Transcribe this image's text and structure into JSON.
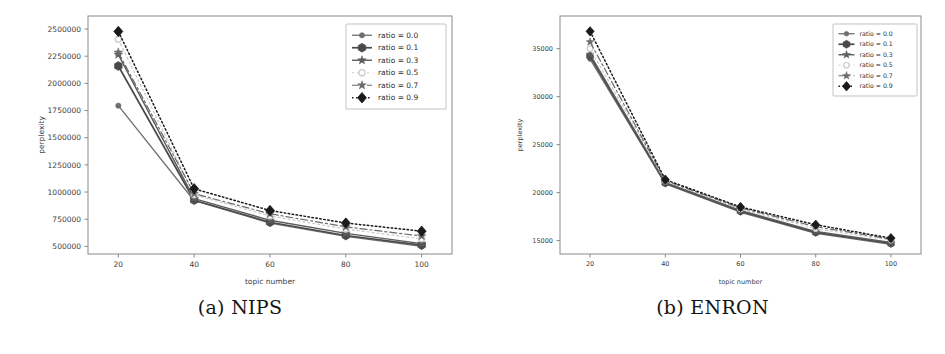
{
  "figure": {
    "subfigures": [
      {
        "id": "a",
        "caption": "(a) NIPS",
        "caption_tag": "(a)",
        "caption_name": "NIPS"
      },
      {
        "id": "b",
        "caption": "(b) ENRON",
        "caption_tag": "(b)",
        "caption_name": "ENRON"
      }
    ]
  },
  "chart_data": [
    {
      "type": "line",
      "id": "nips",
      "title": "(a) NIPS",
      "xlabel": "topic number",
      "ylabel": "perplexity",
      "x": [
        20,
        40,
        60,
        80,
        100
      ],
      "xticklabels": [
        "20",
        "40",
        "60",
        "80",
        "100"
      ],
      "xlim": [
        12,
        108
      ],
      "ylim": [
        430000,
        2620000
      ],
      "yticks": [
        500000,
        750000,
        1000000,
        1250000,
        1500000,
        1750000,
        2000000,
        2250000,
        2500000
      ],
      "yticklabels": [
        "500000",
        "750000",
        "1000000",
        "1250000",
        "1500000",
        "1750000",
        "2000000",
        "2250000",
        "2500000"
      ],
      "grid": false,
      "legend_position": "upper right",
      "series": [
        {
          "name": "ratio = 0.0",
          "values": [
            1795000,
            920000,
            715000,
            592000,
            500000
          ],
          "color": "#6f6f6f",
          "marker": "circle",
          "dash": "none",
          "width": 1.3,
          "markersize": 3.2
        },
        {
          "name": "ratio = 0.1",
          "values": [
            2160000,
            925000,
            722000,
            600000,
            512000
          ],
          "color": "#4a4a4a",
          "marker": "hexagon",
          "dash": "none",
          "width": 1.7,
          "markersize": 4.4
        },
        {
          "name": "ratio = 0.3",
          "values": [
            2265000,
            940000,
            740000,
            620000,
            525000
          ],
          "color": "#5c5c5c",
          "marker": "star",
          "dash": "none",
          "width": 1.4,
          "markersize": 4.0
        },
        {
          "name": "ratio = 0.5",
          "values": [
            2405000,
            975000,
            780000,
            660000,
            570000
          ],
          "color": "#c9c9c9",
          "marker": "circle-open",
          "dash": "2,3",
          "width": 1.2,
          "markersize": 3.6
        },
        {
          "name": "ratio = 0.7",
          "values": [
            2285000,
            985000,
            800000,
            680000,
            595000
          ],
          "color": "#6a6a6a",
          "marker": "plus-star",
          "dash": "7,3,2,3",
          "width": 1.2,
          "markersize": 4.0
        },
        {
          "name": "ratio = 0.9",
          "values": [
            2478000,
            1030000,
            830000,
            715000,
            640000
          ],
          "color": "#1a1a1a",
          "marker": "diamond",
          "dash": "1.5,2.5",
          "width": 1.5,
          "markersize": 5.2
        }
      ]
    },
    {
      "type": "line",
      "id": "enron",
      "title": "(b) ENRON",
      "xlabel": "topic number",
      "ylabel": "perplexity",
      "x": [
        20,
        40,
        60,
        80,
        100
      ],
      "xticklabels": [
        "20",
        "40",
        "60",
        "80",
        "100"
      ],
      "xlim": [
        12,
        108
      ],
      "ylim": [
        13600,
        38400
      ],
      "yticks": [
        15000,
        20000,
        25000,
        30000,
        35000
      ],
      "yticklabels": [
        "15000",
        "20000",
        "25000",
        "30000",
        "35000"
      ],
      "grid": false,
      "legend_position": "upper right",
      "series": [
        {
          "name": "ratio = 0.0",
          "values": [
            33900,
            20900,
            17950,
            15750,
            14600
          ],
          "color": "#6f6f6f",
          "marker": "circle",
          "dash": "none",
          "width": 1.3,
          "markersize": 3.2
        },
        {
          "name": "ratio = 0.1",
          "values": [
            34200,
            21000,
            18050,
            15850,
            14700
          ],
          "color": "#4a4a4a",
          "marker": "hexagon",
          "dash": "none",
          "width": 1.7,
          "markersize": 4.4
        },
        {
          "name": "ratio = 0.3",
          "values": [
            34400,
            21050,
            18150,
            15950,
            14800
          ],
          "color": "#5c5c5c",
          "marker": "star",
          "dash": "none",
          "width": 1.4,
          "markersize": 4.0
        },
        {
          "name": "ratio = 0.5",
          "values": [
            35000,
            21200,
            18300,
            16250,
            15050
          ],
          "color": "#c9c9c9",
          "marker": "circle-open",
          "dash": "2,3",
          "width": 1.2,
          "markersize": 3.6
        },
        {
          "name": "ratio = 0.7",
          "values": [
            35700,
            21250,
            18400,
            16450,
            15150
          ],
          "color": "#6a6a6a",
          "marker": "plus-star",
          "dash": "7,3,2,3",
          "width": 1.2,
          "markersize": 4.0
        },
        {
          "name": "ratio = 0.9",
          "values": [
            36800,
            21350,
            18500,
            16650,
            15250
          ],
          "color": "#1a1a1a",
          "marker": "diamond",
          "dash": "1.5,2.5",
          "width": 1.5,
          "markersize": 5.2
        }
      ]
    }
  ]
}
